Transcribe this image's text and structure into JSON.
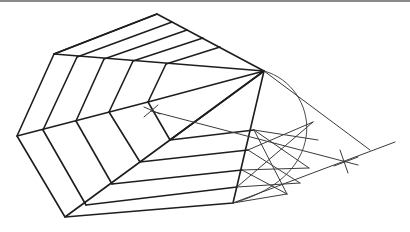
{
  "diagram": {
    "colors": {
      "line": "#1e1e1e",
      "construction": "#3a3a3a",
      "background": "#ffffff",
      "top_border": "#8a8a8a"
    },
    "outer_pentagon": [
      [
        157,
        14
      ],
      [
        264,
        71
      ],
      [
        233,
        203
      ],
      [
        65,
        217
      ],
      [
        17,
        136
      ],
      [
        54,
        54
      ]
    ],
    "apex": [
      264,
      71
    ],
    "arc": {
      "start": [
        264,
        71
      ],
      "end": [
        233,
        203
      ],
      "max_x": 318
    },
    "cross_marks": [
      {
        "name": "cross-mark-left",
        "at": [
          151,
          111
        ]
      },
      {
        "name": "cross-mark-right",
        "at": [
          345,
          161
        ]
      }
    ]
  }
}
